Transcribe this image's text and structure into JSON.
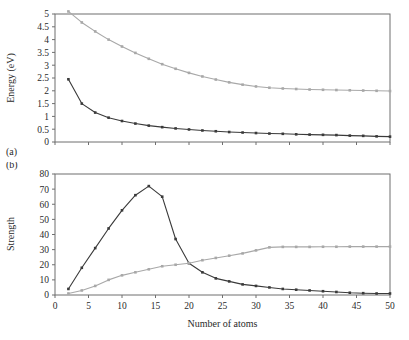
{
  "figure": {
    "panels": [
      {
        "id": "a",
        "panel_label": "(a)",
        "chart_data": {
          "type": "line",
          "title": "",
          "xlabel": "",
          "ylabel": "Energy (eV)",
          "xlim": [
            0,
            50
          ],
          "ylim": [
            0,
            5
          ],
          "xticks": [
            0,
            5,
            10,
            15,
            20,
            25,
            30,
            35,
            40,
            45,
            50
          ],
          "xticklabels": [
            "",
            "",
            "",
            "",
            "",
            "",
            "",
            "",
            "",
            "",
            ""
          ],
          "yticks": [
            0,
            0.5,
            1,
            1.5,
            2,
            2.5,
            3,
            3.5,
            4,
            4.5,
            5
          ],
          "yticklabels": [
            "0",
            "0.5",
            "1",
            "1.5",
            "2",
            "2.5",
            "3",
            "3.5",
            "4",
            "4.5",
            "5"
          ],
          "grid": false,
          "legend": "none",
          "x": [
            2,
            4,
            6,
            8,
            10,
            12,
            14,
            16,
            18,
            20,
            22,
            24,
            26,
            28,
            30,
            32,
            34,
            36,
            38,
            40,
            42,
            44,
            46,
            48,
            50
          ],
          "series": [
            {
              "name": "upper-curve",
              "color": "#a8a8a8",
              "marker": "square",
              "values": [
                5.1,
                4.67,
                4.32,
                4.0,
                3.73,
                3.48,
                3.25,
                3.04,
                2.86,
                2.7,
                2.56,
                2.44,
                2.33,
                2.24,
                2.17,
                2.12,
                2.09,
                2.07,
                2.05,
                2.04,
                2.03,
                2.02,
                2.01,
                2.0,
                1.99
              ]
            },
            {
              "name": "lower-curve",
              "color": "#3a3a3a",
              "marker": "square",
              "values": [
                2.45,
                1.5,
                1.15,
                0.95,
                0.82,
                0.72,
                0.64,
                0.58,
                0.53,
                0.49,
                0.45,
                0.42,
                0.39,
                0.37,
                0.35,
                0.33,
                0.32,
                0.3,
                0.29,
                0.28,
                0.27,
                0.25,
                0.24,
                0.22,
                0.21
              ]
            }
          ]
        }
      },
      {
        "id": "b",
        "panel_label": "(b)",
        "chart_data": {
          "type": "line",
          "title": "",
          "xlabel": "Number of atoms",
          "ylabel": "Strength",
          "xlim": [
            0,
            50
          ],
          "ylim": [
            0,
            80
          ],
          "xticks": [
            0,
            5,
            10,
            15,
            20,
            25,
            30,
            35,
            40,
            45,
            50
          ],
          "xticklabels": [
            "0",
            "5",
            "10",
            "15",
            "20",
            "25",
            "30",
            "35",
            "40",
            "45",
            "50"
          ],
          "yticks": [
            0,
            10,
            20,
            30,
            40,
            50,
            60,
            70,
            80
          ],
          "yticklabels": [
            "0",
            "10",
            "20",
            "30",
            "40",
            "50",
            "60",
            "70",
            "80"
          ],
          "grid": false,
          "legend": "none",
          "x": [
            2,
            4,
            6,
            8,
            10,
            12,
            14,
            16,
            18,
            20,
            22,
            24,
            26,
            28,
            30,
            32,
            34,
            36,
            38,
            40,
            42,
            44,
            46,
            48,
            50
          ],
          "series": [
            {
              "name": "peaked-curve",
              "color": "#3a3a3a",
              "marker": "square",
              "values": [
                4,
                18,
                31,
                44,
                56,
                66,
                72,
                65,
                37,
                21,
                15,
                11,
                9,
                7,
                6,
                5,
                4,
                3.5,
                3,
                2.5,
                2,
                1.5,
                1.2,
                1,
                1
              ]
            },
            {
              "name": "rising-curve",
              "color": "#a8a8a8",
              "marker": "square",
              "values": [
                1,
                3,
                6,
                10,
                13,
                15,
                17,
                19,
                20,
                21,
                23,
                24.5,
                26,
                27.5,
                29.5,
                31.5,
                31.8,
                31.8,
                31.8,
                31.9,
                31.9,
                32,
                32,
                32,
                32
              ]
            }
          ]
        }
      }
    ]
  }
}
